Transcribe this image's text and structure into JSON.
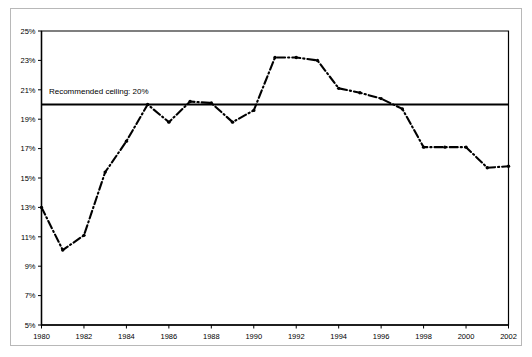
{
  "figure": {
    "background_color": "#ffffff",
    "frame_color": "#b8b8b8",
    "line_color": "#000000"
  },
  "annotation": {
    "ceiling_label": "Recommended ceiling:  20%",
    "ceiling_value": 20
  },
  "chart_data": {
    "type": "line",
    "title": "",
    "subtitle": "",
    "xlabel": "",
    "ylabel": "",
    "xlim": [
      1980,
      2002
    ],
    "ylim": [
      5,
      25
    ],
    "grid": false,
    "legend_position": "none",
    "x_tick_labels": [
      "1980",
      "1982",
      "1984",
      "1986",
      "1988",
      "1990",
      "1992",
      "1994",
      "1996",
      "1998",
      "2000",
      "2002"
    ],
    "x_ticks": [
      1980,
      1982,
      1984,
      1986,
      1988,
      1990,
      1992,
      1994,
      1996,
      1998,
      2000,
      2002
    ],
    "y_tick_labels": [
      "5%",
      "7%",
      "9%",
      "11%",
      "13%",
      "15%",
      "17%",
      "19%",
      "21%",
      "23%",
      "25%"
    ],
    "y_ticks": [
      5,
      7,
      9,
      11,
      13,
      15,
      17,
      19,
      21,
      23,
      25
    ],
    "x": [
      1980,
      1981,
      1982,
      1983,
      1984,
      1985,
      1986,
      1987,
      1988,
      1989,
      1990,
      1991,
      1992,
      1993,
      1994,
      1995,
      1996,
      1997,
      1998,
      1999,
      2000,
      2001,
      2002
    ],
    "series": [
      {
        "name": "Share",
        "values": [
          13.0,
          10.1,
          11.1,
          15.4,
          17.5,
          20.0,
          18.8,
          20.2,
          20.1,
          18.8,
          19.6,
          23.2,
          23.2,
          23.0,
          21.1,
          20.8,
          20.4,
          19.7,
          17.1,
          17.1,
          17.1,
          15.7,
          15.8
        ],
        "line_style": "dash-dot",
        "marker": "dot",
        "color": "#000000"
      }
    ],
    "annotations": [
      {
        "type": "hline",
        "y": 20,
        "label": "Recommended ceiling:  20%",
        "label_x": 1980.35,
        "label_y": 20.9
      }
    ]
  }
}
